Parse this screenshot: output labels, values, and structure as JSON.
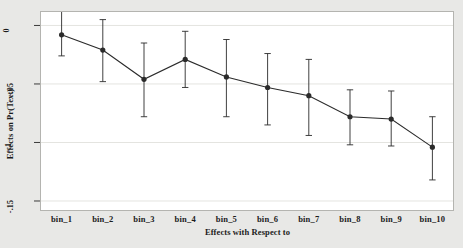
{
  "chart_data": {
    "type": "line",
    "title": "",
    "subtitle": "",
    "xlabel": "Effects with Respect to",
    "ylabel": "Effects on Pr(Text)",
    "categories": [
      "bin_1",
      "bin_2",
      "bin_3",
      "bin_4",
      "bin_5",
      "bin_6",
      "bin_7",
      "bin_8",
      "bin_9",
      "bin_10"
    ],
    "values": [
      -0.008,
      -0.021,
      -0.046,
      -0.029,
      -0.044,
      -0.053,
      -0.06,
      -0.078,
      -0.08,
      -0.104
    ],
    "ci_lower": [
      -0.026,
      -0.048,
      -0.078,
      -0.053,
      -0.078,
      -0.085,
      -0.094,
      -0.102,
      -0.103,
      -0.132
    ],
    "ci_upper": [
      0.012,
      0.005,
      -0.015,
      -0.005,
      -0.012,
      -0.024,
      -0.029,
      -0.055,
      -0.056,
      -0.078
    ],
    "ytick_values": [
      0,
      -0.05,
      -0.1,
      -0.15
    ],
    "ytick_labels": [
      "0",
      "-.05",
      "-.1",
      "-.15"
    ],
    "ylim": [
      -0.1577,
      0.0115
    ],
    "grid": true,
    "grid_axis": "y",
    "legend": null,
    "legend_position": "none",
    "marker": "filled-circle",
    "errorbar_style": "capped-vertical",
    "series_color": "#2b2b2b",
    "grid_color": "#e4e4e0",
    "plot_background": "#ffffff",
    "figure_background": "#e8e8e6",
    "border_color": "#b4b4b0"
  }
}
